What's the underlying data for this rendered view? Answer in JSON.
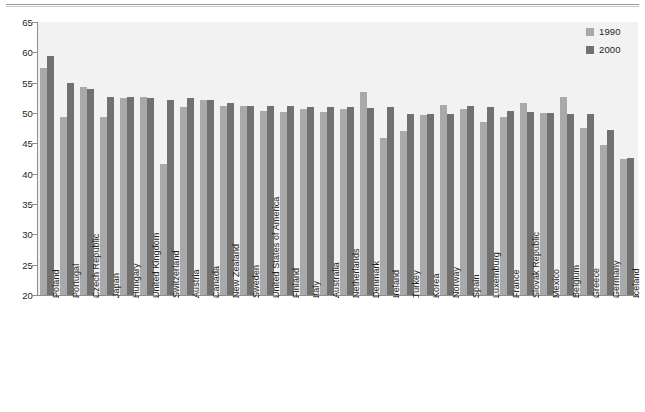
{
  "chart_data": {
    "type": "bar",
    "title": "",
    "xlabel": "",
    "ylabel": "",
    "ylim": [
      20,
      65
    ],
    "yticks": [
      20,
      25,
      30,
      35,
      40,
      45,
      50,
      55,
      60,
      65
    ],
    "grid": false,
    "legend_position": "top-right",
    "categories": [
      "Poland",
      "Portugal",
      "Czech Republic",
      "Japan",
      "Hungary",
      "United Kingdom",
      "Switzerland",
      "Austria",
      "Canada",
      "New Zealand",
      "Sweden",
      "United States of America",
      "Finland",
      "Italy",
      "Australia",
      "Netherlands",
      "Denmark",
      "Ireland",
      "Turkey",
      "Korea",
      "Norway",
      "Spain",
      "Luxemburg",
      "France",
      "Slovak Republic",
      "Mexico",
      "Belgium",
      "Greece",
      "Germany",
      "Iceland"
    ],
    "series": [
      {
        "name": "1990",
        "color": "#a9a9a9",
        "values": [
          57.5,
          49.4,
          54.3,
          49.4,
          52.4,
          52.6,
          41.6,
          51.0,
          52.2,
          51.1,
          51.1,
          50.3,
          50.1,
          50.7,
          50.1,
          50.6,
          53.5,
          45.8,
          47.1,
          49.6,
          51.3,
          50.7,
          48.5,
          49.3,
          51.7,
          50.0,
          52.7,
          47.6,
          44.7,
          42.5
        ]
      },
      {
        "name": "2000",
        "color": "#717171",
        "values": [
          59.4,
          55.0,
          54.0,
          52.7,
          52.6,
          52.4,
          52.1,
          52.4,
          52.2,
          51.7,
          51.2,
          51.1,
          51.1,
          51.0,
          51.0,
          51.0,
          50.9,
          51.0,
          49.8,
          49.8,
          49.9,
          51.2,
          51.0,
          50.4,
          50.2,
          50.0,
          49.9,
          49.9,
          47.2,
          42.6
        ]
      }
    ]
  },
  "legend": {
    "items": [
      {
        "label": "1990",
        "color": "#a9a9a9"
      },
      {
        "label": "2000",
        "color": "#717171"
      }
    ]
  }
}
